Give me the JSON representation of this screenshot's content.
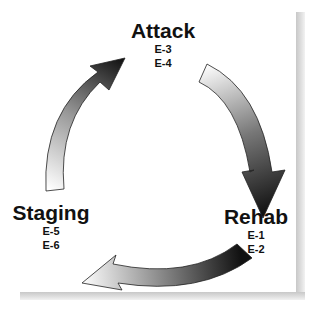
{
  "diagram": {
    "type": "cycle",
    "nodes": [
      {
        "id": "attack",
        "title": "Attack",
        "items": [
          "E-3",
          "E-4"
        ]
      },
      {
        "id": "rehab",
        "title": "Rehab",
        "items": [
          "E-1",
          "E-2"
        ]
      },
      {
        "id": "staging",
        "title": "Staging",
        "items": [
          "E-5",
          "E-6"
        ]
      }
    ],
    "edges": [
      {
        "from": "attack",
        "to": "rehab"
      },
      {
        "from": "rehab",
        "to": "staging"
      },
      {
        "from": "staging",
        "to": "attack"
      }
    ],
    "colors": {
      "arrow_light": "#ffffff",
      "arrow_dark": "#111111",
      "text": "#111111",
      "shadow": "#c8c8c8"
    }
  }
}
